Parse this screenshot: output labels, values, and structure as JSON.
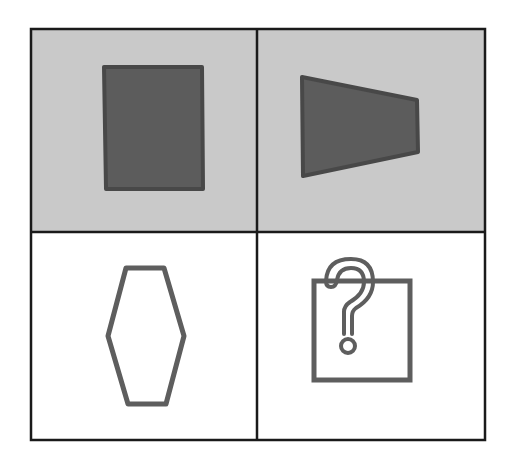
{
  "puzzle": {
    "title": "2x2 shape matrix puzzle",
    "grid": {
      "rows": 2,
      "cols": 2,
      "border_color": "#1a1a1a",
      "border_width": 2.5,
      "bounds": {
        "x1": 31,
        "y1": 29,
        "x2": 485,
        "y2": 440
      },
      "divider_x": 257,
      "divider_y": 232
    },
    "colors": {
      "shaded_bg": "#c9c9c9",
      "white_bg": "#ffffff",
      "dark_fill": "#5c5c5c",
      "dark_stroke": "#484848",
      "outline_stroke": "#5e5e5e"
    },
    "cells": [
      {
        "position": "top-left",
        "background": "shaded",
        "shape": "rectangle",
        "style": "filled",
        "points": "104,67 202,67 203,189 106,189"
      },
      {
        "position": "top-right",
        "background": "shaded",
        "shape": "trapezoid",
        "style": "filled",
        "points": "302,77 417,100 418,152 303,176"
      },
      {
        "position": "bottom-left",
        "background": "white",
        "shape": "hexagon",
        "style": "outline",
        "points": "126,268 164,268 184,336 166,404 128,404 108,336"
      },
      {
        "position": "bottom-right",
        "background": "white",
        "shape": "question-box",
        "style": "unknown",
        "label": "?",
        "box": {
          "x": 314,
          "y": 281,
          "w": 96,
          "h": 99
        }
      }
    ]
  }
}
